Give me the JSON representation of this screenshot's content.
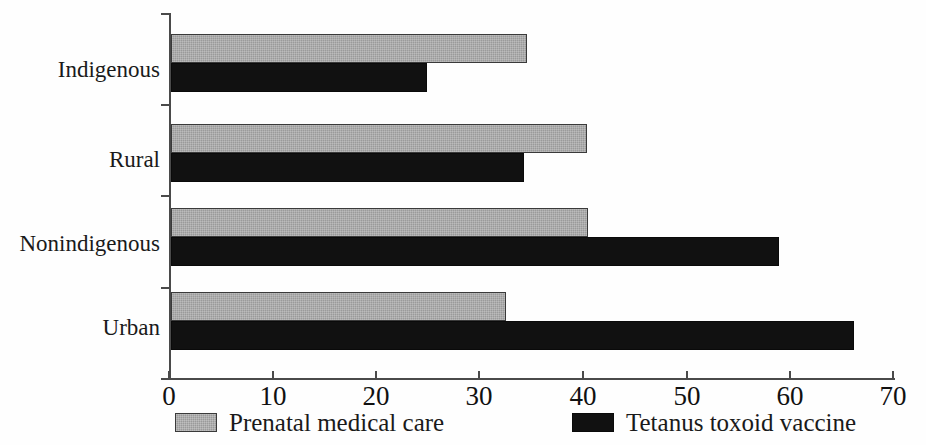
{
  "chart_data": {
    "type": "bar",
    "orientation": "horizontal",
    "title": "",
    "subtitle": "",
    "xlabel": "",
    "ylabel": "",
    "xlim": [
      0,
      70
    ],
    "ylim": null,
    "grid": false,
    "legend_position": "bottom",
    "categories": [
      "Urban",
      "Nonindigenous",
      "Rural",
      "Indigenous"
    ],
    "categories_top_to_bottom": [
      "Indigenous",
      "Rural",
      "Nonindigenous",
      "Urban"
    ],
    "xticks": [
      0,
      10,
      20,
      30,
      40,
      50,
      60,
      70
    ],
    "xtick_labels": [
      "0",
      "10",
      "20",
      "30",
      "40",
      "50",
      "60",
      "70"
    ],
    "series": [
      {
        "name": "Prenatal medical care",
        "color": "#9a9a9a",
        "values_top_to_bottom": [
          34.6,
          40.4,
          40.5,
          32.5
        ]
      },
      {
        "name": "Tetanus toxoid vaccine",
        "color": "#111111",
        "values_top_to_bottom": [
          24.9,
          34.3,
          59.0,
          66.3
        ]
      }
    ]
  },
  "axis": {
    "x_ticks": [
      {
        "value": 0,
        "label": "0"
      },
      {
        "value": 10,
        "label": "10"
      },
      {
        "value": 20,
        "label": "20"
      },
      {
        "value": 30,
        "label": "30"
      },
      {
        "value": 40,
        "label": "40"
      },
      {
        "value": 50,
        "label": "50"
      },
      {
        "value": 60,
        "label": "60"
      },
      {
        "value": 70,
        "label": "70"
      }
    ],
    "y_categories": [
      {
        "label": "Indigenous"
      },
      {
        "label": "Rural"
      },
      {
        "label": "Nonindigenous"
      },
      {
        "label": "Urban"
      }
    ]
  },
  "bars": [
    {
      "category": "Indigenous",
      "series": "Prenatal medical care",
      "value": 34.6
    },
    {
      "category": "Indigenous",
      "series": "Tetanus toxoid vaccine",
      "value": 24.9
    },
    {
      "category": "Rural",
      "series": "Prenatal medical care",
      "value": 40.4
    },
    {
      "category": "Rural",
      "series": "Tetanus toxoid vaccine",
      "value": 34.3
    },
    {
      "category": "Nonindigenous",
      "series": "Prenatal medical care",
      "value": 40.5
    },
    {
      "category": "Nonindigenous",
      "series": "Tetanus toxoid vaccine",
      "value": 59.0
    },
    {
      "category": "Urban",
      "series": "Prenatal medical care",
      "value": 32.5
    },
    {
      "category": "Urban",
      "series": "Tetanus toxoid vaccine",
      "value": 66.3
    }
  ],
  "legend": {
    "items": [
      {
        "label": "Prenatal medical care",
        "color": "#9a9a9a",
        "swatch": "gray-swatch-icon"
      },
      {
        "label": "Tetanus toxoid vaccine",
        "color": "#111111",
        "swatch": "black-swatch-icon"
      }
    ]
  },
  "colors": {
    "prenatal": "#9a9a9a",
    "tetanus": "#111111",
    "axis": "#4a4a4a",
    "text": "#1a1a1a",
    "background": "#ffffff"
  }
}
